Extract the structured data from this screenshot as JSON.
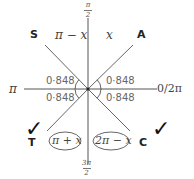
{
  "diagram": {
    "type": "CAST quadrant diagram",
    "center": [
      88,
      89
    ],
    "axes": {
      "top": {
        "numerator": "π",
        "denominator": "2"
      },
      "bottom": {
        "numerator": "3π",
        "denominator": "2"
      },
      "left": "π",
      "right": "0/2π"
    },
    "quadrants": {
      "top_left": {
        "letter": "S",
        "expression": "π − x"
      },
      "top_right": {
        "letter": "A",
        "expression": "x"
      },
      "bottom_left": {
        "letter": "T",
        "expression": "π + x",
        "circled": true,
        "checked": true
      },
      "bottom_right": {
        "letter": "C",
        "expression": "2π − x",
        "circled": true,
        "checked": true
      }
    },
    "angles": {
      "top_left": "0·848",
      "top_right": "0·848",
      "bottom_left": "0·848",
      "bottom_right": "0·848"
    },
    "check_mark": "✓",
    "colors": {
      "line": "#555555",
      "text": "#444444",
      "angle_text": "#666666"
    }
  }
}
